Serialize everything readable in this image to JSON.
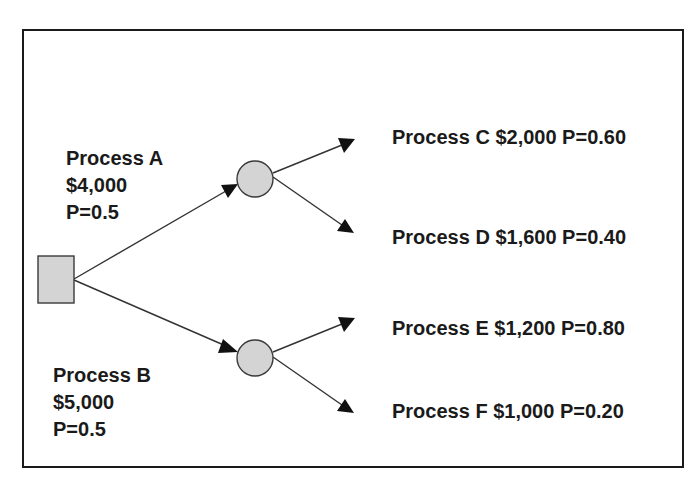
{
  "diagram": {
    "type": "decision-tree",
    "decision_node": {
      "shape": "square",
      "icon": "decision-square-icon"
    },
    "branches": [
      {
        "name": "Process A",
        "cost": "$4,000",
        "probability": "P=0.5",
        "chance_node": {
          "shape": "circle",
          "icon": "chance-circle-icon"
        },
        "outcomes": [
          {
            "name": "Process C",
            "value": "$2,000",
            "probability": "P=0.60",
            "label": "Process C $2,000 P=0.60"
          },
          {
            "name": "Process D",
            "value": "$1,600",
            "probability": "P=0.40",
            "label": "Process D $1,600 P=0.40"
          }
        ]
      },
      {
        "name": "Process B",
        "cost": "$5,000",
        "probability": "P=0.5",
        "chance_node": {
          "shape": "circle",
          "icon": "chance-circle-icon"
        },
        "outcomes": [
          {
            "name": "Process E",
            "value": "$1,200",
            "probability": "P=0.80",
            "label": "Process E $1,200 P=0.80"
          },
          {
            "name": "Process F",
            "value": "$1,000",
            "probability": "P=0.20",
            "label": "Process F $1,000 P=0.20"
          }
        ]
      }
    ],
    "colors": {
      "node_fill": "#d4d4d4",
      "node_stroke": "#3a3a3a",
      "edge": "#333333",
      "arrowhead": "#111111",
      "frame": "#1a1a1a",
      "text": "#1a1a1a"
    }
  }
}
